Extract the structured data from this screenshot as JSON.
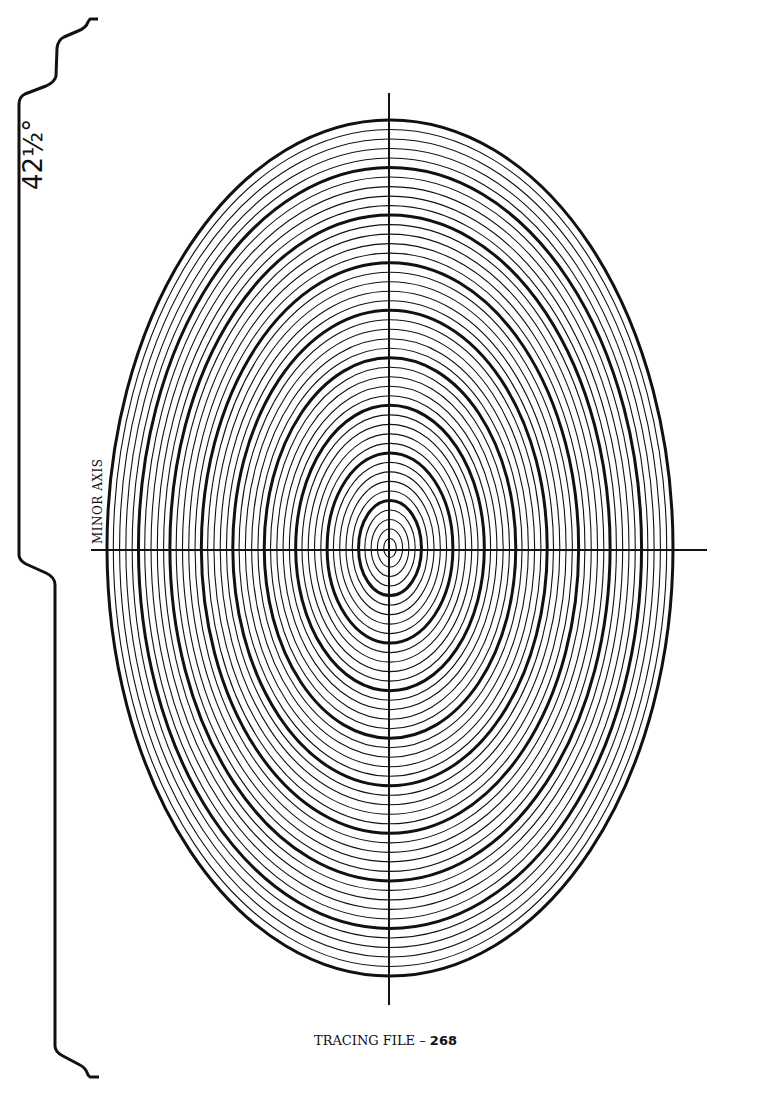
{
  "angle_label": "42½°",
  "axis_label": "MINOR AXIS",
  "footer": {
    "prefix": "TRACING FILE – ",
    "number": "268"
  },
  "diagram": {
    "type": "concentric-ellipse-guide",
    "angle_degrees": 42.5,
    "center": [
      390,
      548
    ],
    "outer_rx": 283,
    "outer_ry": 428,
    "ring_count": 45,
    "thick_every": 5,
    "stroke_color": "#111111"
  }
}
